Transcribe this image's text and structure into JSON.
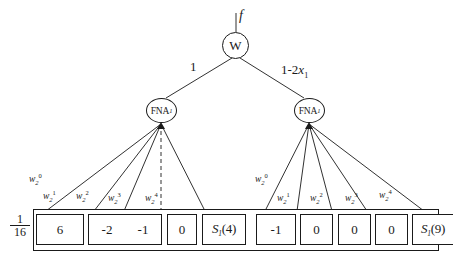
{
  "diagram": {
    "title_label_f": "f",
    "root": {
      "label": "W"
    },
    "fna_left": {
      "label": "FNA",
      "subscript": "1"
    },
    "fna_right": {
      "label": "FNA",
      "subscript": "1"
    },
    "branch_left_label": "1",
    "branch_right_label": "1-2",
    "branch_right_var": "x",
    "branch_right_var_sub": "1",
    "coefficient": {
      "numerator": "1",
      "denominator": "16"
    },
    "weights_left": [
      {
        "base": "w",
        "sub": "2",
        "sup": "0"
      },
      {
        "base": "w",
        "sub": "2",
        "sup": "1"
      },
      {
        "base": "w",
        "sub": "2",
        "sup": "2"
      },
      {
        "base": "w",
        "sub": "2",
        "sup": "3"
      },
      {
        "base": "w",
        "sub": "2",
        "sup": "4"
      }
    ],
    "weights_right": [
      {
        "base": "w",
        "sub": "2",
        "sup": "0"
      },
      {
        "base": "w",
        "sub": "2",
        "sup": "1"
      },
      {
        "base": "w",
        "sub": "2",
        "sup": "2"
      },
      {
        "base": "w",
        "sub": "2",
        "sup": "3"
      },
      {
        "base": "w",
        "sub": "2",
        "sup": "4"
      }
    ],
    "cells_left": [
      {
        "text": "6"
      },
      {
        "text": "-2"
      },
      {
        "text": "-1"
      },
      {
        "text": "0"
      },
      {
        "fn": "S",
        "fn_sub": "1",
        "fn_arg": "(4)"
      }
    ],
    "cells_right": [
      {
        "text": "-1"
      },
      {
        "text": "0"
      },
      {
        "text": "0"
      },
      {
        "text": "0"
      },
      {
        "fn": "S",
        "fn_sub": "1",
        "fn_arg": "(9)"
      }
    ],
    "colors": {
      "stroke": "#1a1a1a",
      "background": "#ffffff"
    }
  }
}
